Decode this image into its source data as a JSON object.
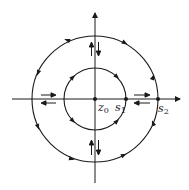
{
  "diagram": {
    "type": "phase-portrait",
    "center": {
      "x": 95,
      "y": 99
    },
    "axes": {
      "horizontal": {
        "x1": 12,
        "x2": 182,
        "y": 99,
        "arrow": "right"
      },
      "vertical": {
        "x": 95,
        "y1": 183,
        "y2": 11,
        "arrow": "up"
      }
    },
    "circles": [
      {
        "name": "inner",
        "r": 31
      },
      {
        "name": "outer",
        "r": 63
      }
    ],
    "points": [
      {
        "name": "z0",
        "x": 95,
        "y": 99
      },
      {
        "name": "s1",
        "x": 126,
        "y": 99
      },
      {
        "name": "s2",
        "x": 158,
        "y": 99
      }
    ],
    "labels": {
      "z0": {
        "base": "z",
        "sub": "0"
      },
      "s1": {
        "base": "s",
        "sub": "1"
      },
      "s2": {
        "base": "s",
        "sub": "2"
      }
    },
    "color": "#1a1a1a"
  }
}
